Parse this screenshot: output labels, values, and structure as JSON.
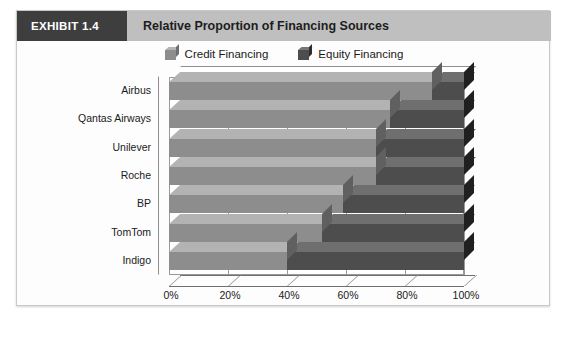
{
  "header": {
    "exhibit_tag": "EXHIBIT 1.4",
    "title": "Relative Proportion of Financing Sources"
  },
  "legend": {
    "items": [
      {
        "label": "Credit Financing",
        "color": "#8d8d8d",
        "icon": "cube-swatch-icon"
      },
      {
        "label": "Equity Financing",
        "color": "#4d4d4d",
        "icon": "cube-swatch-icon"
      }
    ]
  },
  "axis": {
    "x_ticks": [
      "0%",
      "20%",
      "40%",
      "60%",
      "80%",
      "100%"
    ],
    "x_tick_values": [
      0,
      20,
      40,
      60,
      80,
      100
    ]
  },
  "chart_data": {
    "type": "bar",
    "orientation": "horizontal",
    "stacked": true,
    "stack_total": 100,
    "title": "Relative Proportion of Financing Sources",
    "xlabel": "",
    "ylabel": "",
    "xlim": [
      0,
      100
    ],
    "grid": true,
    "legend_position": "top-center",
    "categories": [
      "Airbus",
      "Qantas Airways",
      "Unilever",
      "Roche",
      "BP",
      "TomTom",
      "Indigo"
    ],
    "series": [
      {
        "name": "Credit Financing",
        "color": "#8d8d8d",
        "values": [
          89,
          75,
          70,
          70,
          59,
          52,
          40
        ]
      },
      {
        "name": "Equity Financing",
        "color": "#4d4d4d",
        "values": [
          11,
          25,
          30,
          30,
          41,
          48,
          60
        ]
      }
    ]
  }
}
